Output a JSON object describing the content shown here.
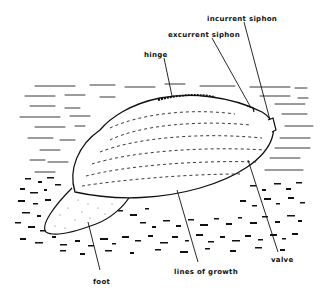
{
  "diagram": {
    "colors": {
      "ink": "#111111",
      "background": "#ffffff"
    },
    "labels": [
      {
        "id": "incurrent-siphon",
        "text": "incurrent siphon",
        "x": 207,
        "y": 15
      },
      {
        "id": "excurrent-siphon",
        "text": "excurrent siphon",
        "x": 168,
        "y": 31
      },
      {
        "id": "hinge",
        "text": "hinge",
        "x": 144,
        "y": 51
      },
      {
        "id": "valve",
        "text": "valve",
        "x": 271,
        "y": 256
      },
      {
        "id": "lines-of-growth",
        "text": "lines of growth",
        "x": 174,
        "y": 268
      },
      {
        "id": "foot",
        "text": "foot",
        "x": 93,
        "y": 278
      }
    ]
  }
}
